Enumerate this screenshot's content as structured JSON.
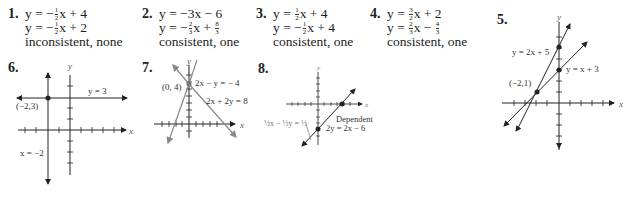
{
  "problems": [
    {
      "number": "1.",
      "eq1": {
        "pre": "y = −",
        "fn": "1",
        "fd": "2",
        "post": "x + 4"
      },
      "eq2": {
        "pre": "y = −",
        "fn": "1",
        "fd": "2",
        "post": "x + 2"
      },
      "answer": "inconsistent, none"
    },
    {
      "number": "2.",
      "eq1": {
        "pre": "y = −3x − 6"
      },
      "eq2": {
        "pre": "y = −",
        "fn": "2",
        "fd": "3",
        "post": "x +",
        "fn2": "8",
        "fd2": "3"
      },
      "answer": "consistent, one"
    },
    {
      "number": "3.",
      "eq1": {
        "pre": "y = ",
        "fn": "1",
        "fd": "2",
        "post": "x + 4"
      },
      "eq2": {
        "pre": "y = −",
        "fn": "1",
        "fd": "2",
        "post": "x + 4"
      },
      "answer": "consistent, one"
    },
    {
      "number": "4.",
      "eq1": {
        "pre": "y = ",
        "fn": "3",
        "fd": "2",
        "post": "x + 2"
      },
      "eq2": {
        "pre": "y = ",
        "fn": "2",
        "fd": "3",
        "post": "x −",
        "fn2": "4",
        "fd2": "3"
      },
      "answer": "consistent, one"
    }
  ],
  "graphs": {
    "g5": {
      "number": "5.",
      "axis_x": "x",
      "axis_y": "y",
      "line1": "y = 2x + 5",
      "line2": "y = x + 3",
      "point": "(−2,1)"
    },
    "g6": {
      "number": "6.",
      "axis_x": "x",
      "axis_y": "y",
      "line1": "y = 3",
      "line2": "x = −2",
      "point": "(−2,3)"
    },
    "g7": {
      "number": "7.",
      "axis_x": "x",
      "axis_y": "y",
      "line1": "2x − y = − 4",
      "line2": "2x + 2y = 8",
      "point": "(0, 4)"
    },
    "g8": {
      "number": "8.",
      "axis_x": "x",
      "axis_y": "y",
      "line1": "½x − ½y = ½",
      "label": "Dependent",
      "line2": "2y = 2x − 6"
    }
  }
}
